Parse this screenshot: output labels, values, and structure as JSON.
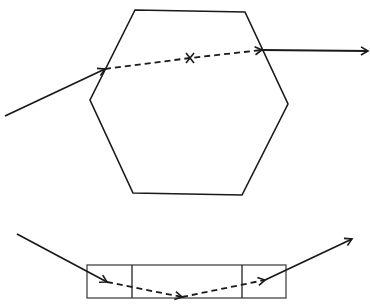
{
  "diagram": {
    "background": "#ffffff",
    "stroke_color": "#1a1a1a",
    "top_figure": {
      "shape": "hexagon",
      "hexagon_points": [
        [
          135,
          10
        ],
        [
          245,
          12
        ],
        [
          288,
          104
        ],
        [
          242,
          195
        ],
        [
          133,
          193
        ],
        [
          90,
          100
        ]
      ],
      "incoming_ray": {
        "from": [
          5,
          116
        ],
        "to": [
          105,
          69
        ]
      },
      "internal_ray_dashed": [
        [
          105,
          69
        ],
        [
          190,
          58
        ],
        [
          262,
          50
        ]
      ],
      "center_marker": {
        "symbol": "x",
        "at": [
          190,
          58
        ]
      },
      "outgoing_ray": {
        "from": [
          262,
          50
        ],
        "to": [
          368,
          51
        ]
      }
    },
    "bottom_figure": {
      "shape": "rectangle-with-sections",
      "rect": {
        "x": 87,
        "y": 265,
        "width": 199,
        "height": 33
      },
      "dividers_x": [
        132,
        242
      ],
      "incoming_ray": {
        "from": [
          17,
          234
        ],
        "to": [
          107,
          282
        ]
      },
      "internal_ray_dashed": [
        [
          107,
          282
        ],
        [
          182,
          297
        ],
        [
          265,
          280
        ]
      ],
      "outgoing_ray": {
        "from": [
          265,
          280
        ],
        "to": [
          352,
          239
        ]
      }
    }
  }
}
